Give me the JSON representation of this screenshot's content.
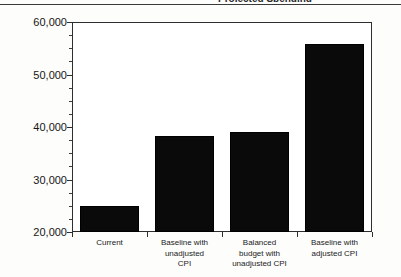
{
  "figure": {
    "title_clipped": "Projected Spending",
    "title_note": "title cropped at top edge of scan",
    "background_color": "#fdfdfc",
    "bar_color": "#0a0a0a",
    "axis_color": "#2e2e2e"
  },
  "chart_data": {
    "type": "bar",
    "title": "Projected Spending",
    "xlabel": "",
    "ylabel": "",
    "categories": [
      "Current",
      "Baseline with unadjusted CPI",
      "Balanced budget with unadjusted CPI",
      "Baseline with adjusted CPI"
    ],
    "category_lines": [
      [
        "Current"
      ],
      [
        "Baseline with",
        "unadjusted",
        "CPI"
      ],
      [
        "Balanced",
        "budget with",
        "unadjusted CPI"
      ],
      [
        "Baseline with",
        "adjusted CPI"
      ]
    ],
    "values": [
      25000,
      38300,
      39000,
      55800
    ],
    "ylim": [
      20000,
      60000
    ],
    "ytick_values": [
      20000,
      30000,
      40000,
      50000,
      60000
    ],
    "ytick_labels": [
      "20,000",
      "30,000",
      "40,000",
      "50,000",
      "60,000"
    ],
    "yminor_step": 2500,
    "grid": false,
    "legend": null,
    "legend_position": "none"
  }
}
